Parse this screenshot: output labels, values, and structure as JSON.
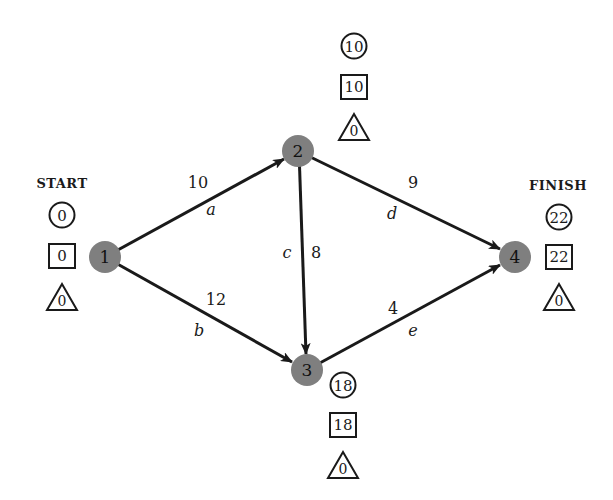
{
  "diagram": {
    "type": "activity-on-arrow network (critical path)",
    "labels": {
      "start": "START",
      "finish": "FINISH"
    },
    "colors": {
      "node_fill": "#7f7f7f",
      "line": "#1a1a1a",
      "background": "#ffffff"
    },
    "legend_shapes": {
      "circle": "earliest time",
      "square": "latest time",
      "triangle": "slack"
    },
    "nodes": [
      {
        "id": "1",
        "label": "1",
        "earliest": "0",
        "latest": "0",
        "slack": "0"
      },
      {
        "id": "2",
        "label": "2",
        "earliest": "10",
        "latest": "10",
        "slack": "0"
      },
      {
        "id": "3",
        "label": "3",
        "earliest": "18",
        "latest": "18",
        "slack": "0"
      },
      {
        "id": "4",
        "label": "4",
        "earliest": "22",
        "latest": "22",
        "slack": "0"
      }
    ],
    "edges": [
      {
        "from": "1",
        "to": "2",
        "activity": "a",
        "duration": "10"
      },
      {
        "from": "1",
        "to": "3",
        "activity": "b",
        "duration": "12"
      },
      {
        "from": "2",
        "to": "3",
        "activity": "c",
        "duration": "8"
      },
      {
        "from": "2",
        "to": "4",
        "activity": "d",
        "duration": "9"
      },
      {
        "from": "3",
        "to": "4",
        "activity": "e",
        "duration": "4"
      }
    ]
  }
}
